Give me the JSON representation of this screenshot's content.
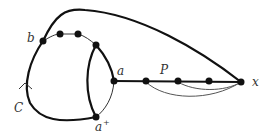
{
  "diagram": {
    "labels": {
      "b": "b",
      "C": "C",
      "a": "a",
      "a_plus": "a",
      "a_plus_sup": "+",
      "P": "P",
      "x": "x"
    },
    "colors": {
      "edge": "#111111",
      "thin_edge": "#555555",
      "node": "#111111"
    }
  }
}
